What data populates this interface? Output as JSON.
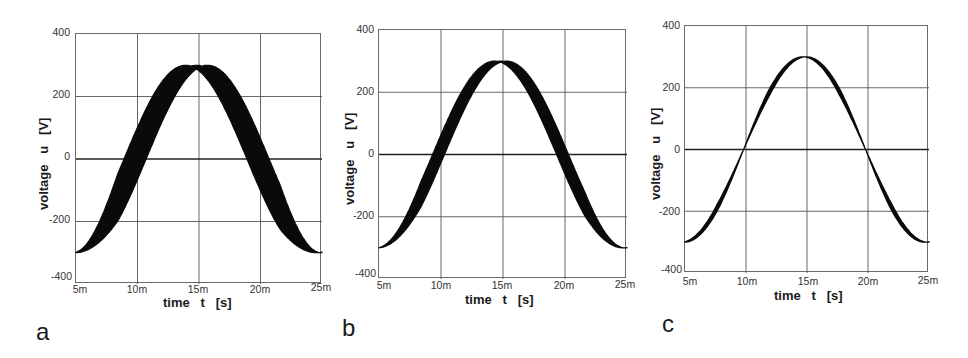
{
  "figure": {
    "panels": [
      {
        "letter": "a",
        "ylabel": "voltage   u   [V]",
        "xlabel": "time   t   [s]"
      },
      {
        "letter": "b",
        "ylabel": "voltage   u   [V]",
        "xlabel": "time   t   [s]"
      },
      {
        "letter": "c",
        "ylabel": "voltage   u   [V]",
        "xlabel": "time   t   [s]"
      }
    ]
  },
  "chart_data": [
    {
      "type": "line",
      "title": "a",
      "xlabel": "time t [s]",
      "ylabel": "voltage u [V]",
      "x_ticks": [
        "5m",
        "10m",
        "15m",
        "20m",
        "25m"
      ],
      "y_ticks": [
        "400",
        "200",
        "0",
        "-200",
        "-400"
      ],
      "xlim": [
        0.005,
        0.025
      ],
      "ylim": [
        -400,
        400
      ],
      "grid": true,
      "series": [
        {
          "name": "u(t) envelope band",
          "description": "cosine-shaped voltage, amplitude ~300 V, period 20 ms, wide phase-jitter band",
          "amplitude": 300,
          "period_s": 0.02,
          "min_at_s": 0.005,
          "peak_at_s": 0.0148,
          "band_type": "phase",
          "band_halfwidth_s": 0.0009,
          "x": [
            0.005,
            0.0075,
            0.01,
            0.0125,
            0.015,
            0.0175,
            0.02,
            0.0225,
            0.025
          ],
          "values": [
            -300,
            -212,
            0,
            212,
            300,
            212,
            0,
            -212,
            -300
          ]
        }
      ]
    },
    {
      "type": "line",
      "title": "b",
      "xlabel": "time t [s]",
      "ylabel": "voltage u [V]",
      "x_ticks": [
        "5m",
        "10m",
        "15m",
        "20m",
        "25m"
      ],
      "y_ticks": [
        "400",
        "200",
        "0",
        "-200",
        "-400"
      ],
      "xlim": [
        0.005,
        0.025
      ],
      "ylim": [
        -400,
        400
      ],
      "grid": true,
      "series": [
        {
          "name": "u(t) envelope band",
          "description": "cosine-shaped voltage, amplitude ~300 V, period 20 ms, medium phase-jitter band",
          "amplitude": 300,
          "period_s": 0.02,
          "min_at_s": 0.005,
          "peak_at_s": 0.0148,
          "band_type": "phase",
          "band_halfwidth_s": 0.00048,
          "x": [
            0.005,
            0.0075,
            0.01,
            0.0125,
            0.015,
            0.0175,
            0.02,
            0.0225,
            0.025
          ],
          "values": [
            -300,
            -212,
            0,
            212,
            300,
            212,
            0,
            -212,
            -300
          ]
        }
      ]
    },
    {
      "type": "line",
      "title": "c",
      "xlabel": "time t [s]",
      "ylabel": "voltage u [V]",
      "x_ticks": [
        "5m",
        "10m",
        "15m",
        "20m",
        "25m"
      ],
      "y_ticks": [
        "400",
        "200",
        "0",
        "-200",
        "-400"
      ],
      "xlim": [
        0.005,
        0.025
      ],
      "ylim": [
        -400,
        400
      ],
      "grid": true,
      "series": [
        {
          "name": "u(t) envelope band",
          "description": "cosine-shaped voltage, amplitude ~300 V, period 20 ms, narrow band pinched at zero crossings (10 ms, 20 ms)",
          "amplitude": 300,
          "period_s": 0.02,
          "min_at_s": 0.005,
          "peak_at_s": 0.0148,
          "band_type": "pinched",
          "band_halfwidth_s": 0.0003,
          "x": [
            0.005,
            0.0075,
            0.01,
            0.0125,
            0.015,
            0.0175,
            0.02,
            0.0225,
            0.025
          ],
          "values": [
            -300,
            -212,
            0,
            212,
            300,
            212,
            0,
            -212,
            -300
          ]
        }
      ]
    }
  ]
}
